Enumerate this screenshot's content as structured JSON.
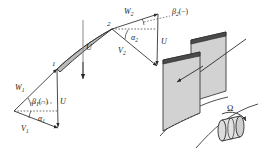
{
  "figure": {
    "type": "turbomachinery-velocity-triangle-diagram",
    "background_color": "#ffffff",
    "line_color": "#2b2b2b",
    "blade_fill": "#cfcfcf",
    "surface_fill": "#d0d0d0",
    "surface_edge": "#3a3a3a"
  },
  "station_labels": {
    "inlet": "1",
    "outlet": "2"
  },
  "blade_passage": {
    "peripheral_speed_label": "U"
  },
  "triangle_outlet": {
    "relative_velocity": "W",
    "relative_velocity_sub": "2",
    "absolute_velocity": "V",
    "absolute_velocity_sub": "2",
    "blade_speed": "U",
    "relative_flow_angle": "β",
    "relative_flow_angle_sub": "2",
    "relative_flow_angle_sign": "(−)",
    "absolute_flow_angle": "α",
    "absolute_flow_angle_sub": "2"
  },
  "triangle_inlet": {
    "relative_velocity": "W",
    "relative_velocity_sub": "1",
    "absolute_velocity": "V",
    "absolute_velocity_sub": "1",
    "blade_speed": "U",
    "relative_flow_angle": "β",
    "relative_flow_angle_sub": "1",
    "relative_flow_angle_sign": "(−)",
    "absolute_flow_angle": "α",
    "absolute_flow_angle_sub": "1"
  },
  "rotor": {
    "rotation_symbol": "Ω",
    "blade_count_shown": 2
  }
}
